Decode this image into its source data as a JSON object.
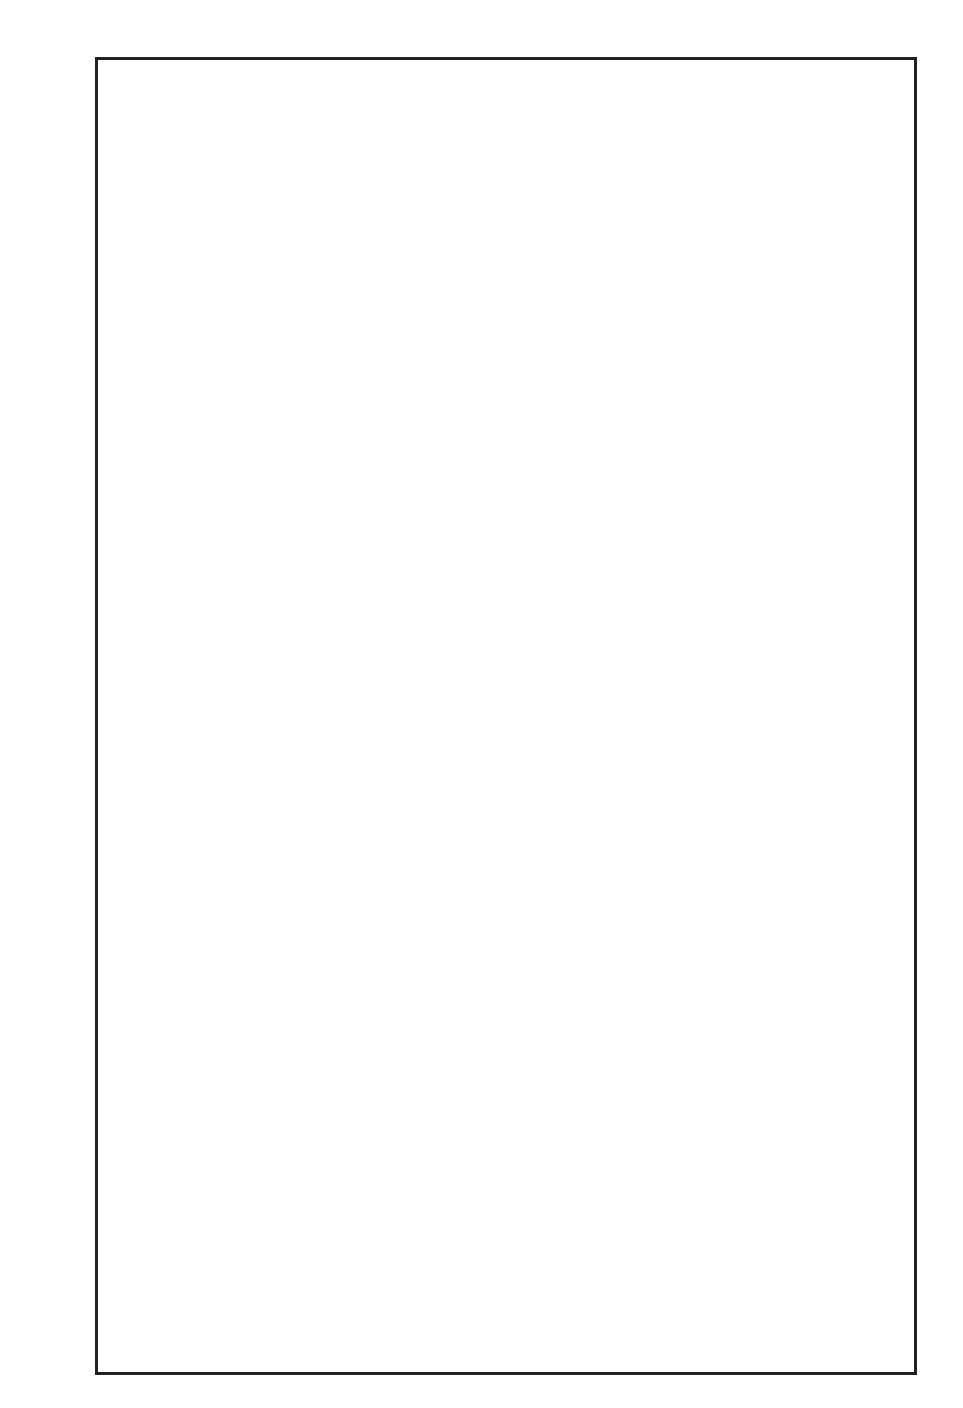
{
  "caption": "ALIN, PROTHERO, AND LUND",
  "headers": {
    "ma": "Ma",
    "pol": "POL.",
    "chrons": "CHRONS",
    "epochs": "EPOCHS",
    "formations": "FORMATIONS\nIN SAN DIEGO",
    "nalma": "NALMA",
    "planktic": "Planktic\nForam\nZones",
    "calc": "Calc.\nNanno.\nZones",
    "mollusc": "W. Coast\nMollusc\n\"Stages\"",
    "benthic": "Benthic\nForam\nStages"
  },
  "ma_ticks": [
    "39",
    "40",
    "41",
    "42",
    "43",
    "44",
    "45",
    "46",
    "47",
    "48",
    "49",
    "50"
  ],
  "polarity": {
    "normal_blocks_ma": [
      [
        38.45,
        40.1
      ],
      [
        41.3,
        41.6
      ],
      [
        42.5,
        43.8
      ],
      [
        46.3,
        47.9
      ],
      [
        49.0,
        49.7
      ]
    ],
    "gap_ma": 39.55,
    "labels": [
      {
        "text": "N",
        "ma": 39.3
      },
      {
        "text": "R",
        "ma": 40.75
      },
      {
        "text": "N",
        "ma": 41.45
      },
      {
        "text": "R",
        "ma": 42.05
      },
      {
        "text": "N",
        "ma": 43.2
      },
      {
        "text": "R",
        "ma": 45.05
      },
      {
        "text": "N",
        "ma": 47.15
      },
      {
        "text": "R",
        "ma": 48.45
      },
      {
        "text": "N",
        "ma": 49.35
      },
      {
        "text": "R",
        "ma": 50.05
      }
    ]
  },
  "chrons": [
    {
      "num": "18",
      "ma": 39.85
    },
    {
      "num": "19",
      "ma": 41.9
    },
    {
      "num": "20",
      "ma": 44.4
    },
    {
      "num": "21",
      "ma": 47.55
    },
    {
      "num": "22",
      "ma": 49.65
    }
  ],
  "epochs": {
    "main": "EOCENE",
    "main_letters": [
      "E",
      "N",
      "E",
      "C",
      "O",
      "E"
    ],
    "sub_middle_letters": [
      "E",
      "L",
      "D",
      "D",
      "I",
      "M"
    ],
    "sub_early": "EARLY"
  },
  "formations": [
    {
      "label": "Emv",
      "top": 42.3,
      "bottom": 42.95
    },
    {
      "label": "Est-b",
      "q1": "?",
      "q2": "?"
    },
    {
      "label": "Est-a",
      "top": 44.4,
      "bottom": 44.9
    },
    {
      "label": "?",
      "ma": 45.2
    },
    {
      "label": "Ef",
      "top": 45.5,
      "bottom": 46.5
    },
    {
      "label": "Esc",
      "top": 46.5,
      "bottom": 46.85
    },
    {
      "label": "Ea",
      "top": 46.95,
      "bottom": 47.5
    },
    {
      "label": "Ed",
      "top": 48.15,
      "bottom": 48.5
    }
  ],
  "nalma": {
    "duchesnean": "DUCHESNEAN",
    "uintan": "UINTAN",
    "uintan_letters": [
      "U",
      "I",
      "N",
      "T",
      "A",
      "N"
    ],
    "late": "late",
    "early": "early",
    "bridgerian": "BRIDGERIAN",
    "was": "WAS."
  },
  "planktic": [
    {
      "label": "P14",
      "top": 38.45,
      "bottom": 40.1
    },
    {
      "label": "P13",
      "top": 40.1,
      "bottom": 40.5
    },
    {
      "label": "P12",
      "top": 40.5,
      "bottom": 43.6
    },
    {
      "label": "P11",
      "top": 43.6,
      "bottom": 46.0
    },
    {
      "label": "P10",
      "top": 46.0,
      "bottom": 49.0
    },
    {
      "label": "P9",
      "top": 49.0,
      "bottom": 50.6
    }
  ],
  "calc": {
    "zones": [
      {
        "label": "CP",
        "num": "14",
        "top": 38.45,
        "bottom": 43.65,
        "subs": [
          {
            "l": "b",
            "top": 38.45,
            "bottom": 40.3
          },
          {
            "l": "a",
            "top": 40.3,
            "bottom": 43.65
          }
        ]
      },
      {
        "label": "CP",
        "num": "13",
        "top": 43.65,
        "bottom": 47.3,
        "subs": [
          {
            "l": "c",
            "top": 43.65,
            "bottom": 44.6
          },
          {
            "l": "b",
            "top": 44.6,
            "bottom": 46.15
          },
          {
            "l": "a",
            "top": 46.15,
            "bottom": 47.3
          }
        ]
      },
      {
        "label": "CP",
        "num": "12",
        "top": 47.3,
        "bottom": 49.65,
        "subs": [
          {
            "l": "b",
            "top": 47.3,
            "bottom": 48.5
          },
          {
            "l": "a",
            "top": 48.5,
            "bottom": 49.65
          }
        ]
      },
      {
        "label": "CP11",
        "top": 49.65,
        "bottom": 50.6
      }
    ]
  },
  "mollusc": {
    "tejon": "\"T E J O N\"",
    "transition": "\"TRANSITION\"",
    "domengine": "\"D O M E N G I N E\"",
    "capay": "'CAPAY\""
  },
  "benthic": {
    "narizian": "N A R I Z I A N",
    "penutian": "\"P E N U T I A N\"",
    "ulatisian": "ULATISIAN"
  }
}
